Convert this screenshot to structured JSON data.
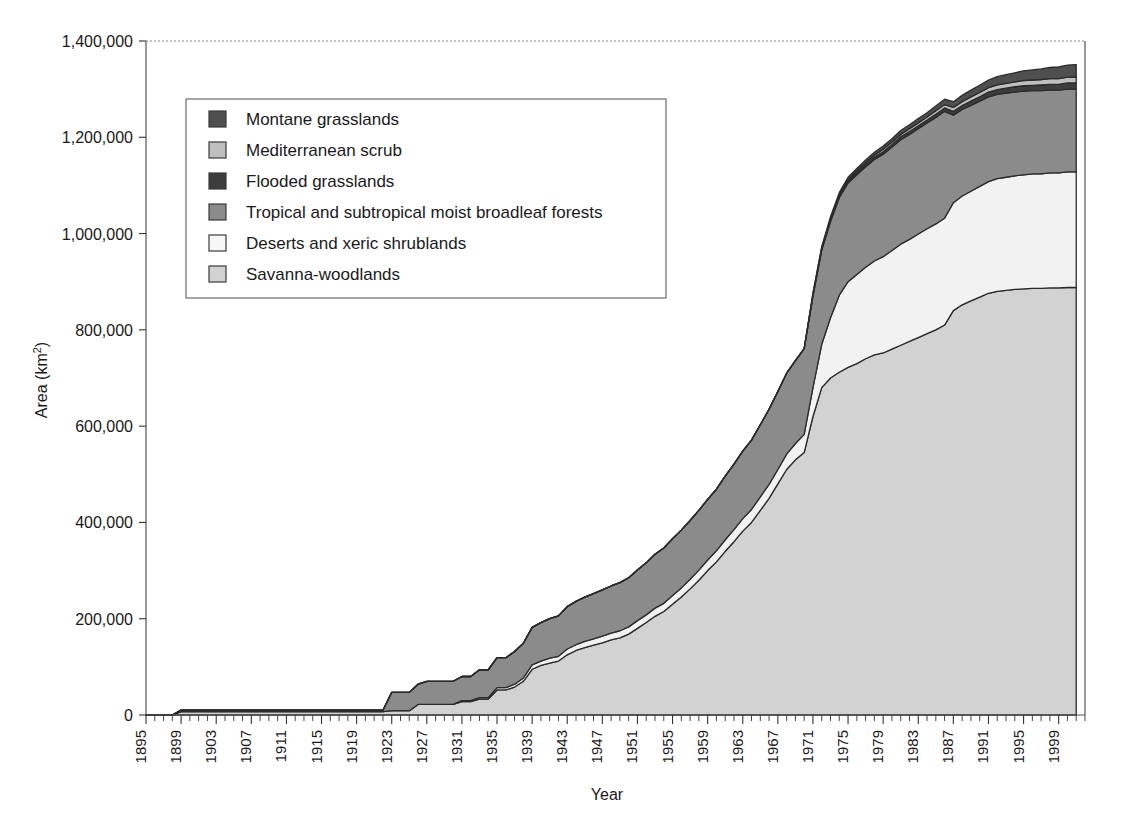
{
  "chart_data": {
    "type": "area",
    "title": "",
    "xlabel": "Year",
    "ylabel": "Area (km2)",
    "ylabel_display": "Area (km²)",
    "stacked": true,
    "grid": false,
    "legend_position": "upper-left-inside",
    "xlim": [
      1895,
      2002
    ],
    "ylim": [
      0,
      1400000
    ],
    "ytick_labels": [
      "1,400,000",
      "1,200,000",
      "1,000,000",
      "800,000",
      "600,000",
      "400,000",
      "200,000",
      "0"
    ],
    "ytick_values": [
      1400000,
      1200000,
      1000000,
      800000,
      600000,
      400000,
      200000,
      0
    ],
    "xtick_labels": [
      "1895",
      "1899",
      "1903",
      "1907",
      "1911",
      "1915",
      "1919",
      "1923",
      "1927",
      "1931",
      "1935",
      "1939",
      "1943",
      "1947",
      "1951",
      "1955",
      "1959",
      "1963",
      "1967",
      "1971",
      "1975",
      "1979",
      "1983",
      "1987",
      "1991",
      "1995",
      "1999"
    ],
    "xtick_values": [
      1895,
      1899,
      1903,
      1907,
      1911,
      1915,
      1919,
      1923,
      1927,
      1931,
      1935,
      1939,
      1943,
      1947,
      1951,
      1955,
      1959,
      1963,
      1967,
      1971,
      1975,
      1979,
      1983,
      1987,
      1991,
      1995,
      1999
    ],
    "xtick_step_minor": 1,
    "x": [
      1895,
      1896,
      1897,
      1898,
      1899,
      1900,
      1901,
      1902,
      1903,
      1904,
      1905,
      1906,
      1907,
      1908,
      1909,
      1910,
      1911,
      1912,
      1913,
      1914,
      1915,
      1916,
      1917,
      1918,
      1919,
      1920,
      1921,
      1922,
      1923,
      1924,
      1925,
      1926,
      1927,
      1928,
      1929,
      1930,
      1931,
      1932,
      1933,
      1934,
      1935,
      1936,
      1937,
      1938,
      1939,
      1940,
      1941,
      1942,
      1943,
      1944,
      1945,
      1946,
      1947,
      1948,
      1949,
      1950,
      1951,
      1952,
      1953,
      1954,
      1955,
      1956,
      1957,
      1958,
      1959,
      1960,
      1961,
      1962,
      1963,
      1964,
      1965,
      1966,
      1967,
      1968,
      1969,
      1970,
      1971,
      1972,
      1973,
      1974,
      1975,
      1976,
      1977,
      1978,
      1979,
      1980,
      1981,
      1982,
      1983,
      1984,
      1985,
      1986,
      1987,
      1988,
      1989,
      1990,
      1991,
      1992,
      1993,
      1994,
      1995,
      1996,
      1997,
      1998,
      1999,
      2000,
      2001
    ],
    "series": [
      {
        "name": "Savanna-woodlands",
        "color": "#d2d2d2",
        "stack_order": 1,
        "values": [
          0,
          0,
          0,
          0,
          7000,
          7000,
          7000,
          7000,
          7000,
          7000,
          7000,
          7000,
          7000,
          7000,
          7000,
          7000,
          7000,
          7000,
          7000,
          7000,
          7000,
          7000,
          7000,
          7000,
          7000,
          7000,
          7000,
          7000,
          9000,
          9000,
          9000,
          22000,
          22000,
          22000,
          22000,
          22000,
          28000,
          28000,
          33000,
          33000,
          52000,
          52000,
          58000,
          70000,
          95000,
          103000,
          108000,
          112000,
          125000,
          134000,
          140000,
          145000,
          150000,
          156000,
          160000,
          168000,
          180000,
          192000,
          205000,
          215000,
          230000,
          245000,
          262000,
          280000,
          300000,
          318000,
          340000,
          360000,
          382000,
          400000,
          425000,
          450000,
          480000,
          510000,
          530000,
          545000,
          620000,
          680000,
          700000,
          712000,
          722000,
          730000,
          740000,
          748000,
          752000,
          760000,
          768000,
          776000,
          784000,
          792000,
          800000,
          810000,
          840000,
          852000,
          860000,
          868000,
          876000,
          880000,
          882000,
          884000,
          885000,
          886000,
          886000,
          887000,
          887000,
          888000,
          888000
        ],
        "peak_value": 888000
      },
      {
        "name": "Deserts and xeric shrublands",
        "color": "#f2f2f2",
        "stack_order": 2,
        "values": [
          0,
          0,
          0,
          0,
          0,
          0,
          0,
          0,
          0,
          0,
          0,
          0,
          0,
          0,
          0,
          0,
          0,
          0,
          0,
          0,
          0,
          0,
          0,
          0,
          0,
          0,
          0,
          0,
          0,
          0,
          0,
          0,
          0,
          0,
          0,
          0,
          2000,
          2000,
          3000,
          3000,
          5000,
          5000,
          6000,
          7000,
          9000,
          9000,
          10000,
          10000,
          12000,
          12000,
          13000,
          13000,
          14000,
          14000,
          15000,
          15000,
          16000,
          16000,
          17000,
          17000,
          18000,
          19000,
          20000,
          21000,
          22000,
          23000,
          24000,
          25000,
          26000,
          27000,
          28000,
          29000,
          30000,
          32000,
          34000,
          38000,
          60000,
          90000,
          125000,
          160000,
          178000,
          185000,
          190000,
          195000,
          200000,
          205000,
          210000,
          212000,
          215000,
          218000,
          220000,
          222000,
          224000,
          226000,
          228000,
          230000,
          232000,
          234000,
          235000,
          236000,
          237000,
          238000,
          238000,
          239000,
          239000,
          240000,
          240000
        ],
        "peak_value": 240000
      },
      {
        "name": "Tropical and subtropical moist broadleaf forests",
        "color": "#8b8b8b",
        "stack_order": 3,
        "values": [
          0,
          0,
          0,
          0,
          3000,
          3000,
          3000,
          3000,
          3000,
          3000,
          3000,
          3000,
          3000,
          3000,
          3000,
          3000,
          3000,
          3000,
          3000,
          3000,
          3000,
          3000,
          3000,
          3000,
          3000,
          3000,
          3000,
          3000,
          38000,
          38000,
          38000,
          42000,
          48000,
          48000,
          48000,
          48000,
          50000,
          50000,
          58000,
          58000,
          62000,
          62000,
          68000,
          72000,
          78000,
          80000,
          82000,
          84000,
          88000,
          90000,
          92000,
          94000,
          96000,
          98000,
          100000,
          102000,
          105000,
          108000,
          112000,
          115000,
          118000,
          120000,
          122000,
          124000,
          126000,
          128000,
          132000,
          136000,
          140000,
          144000,
          150000,
          156000,
          162000,
          168000,
          172000,
          178000,
          190000,
          196000,
          200000,
          203000,
          205000,
          207000,
          209000,
          211000,
          213000,
          215000,
          217000,
          218000,
          219000,
          220000,
          221000,
          222000,
          182000,
          180000,
          178000,
          177000,
          176000,
          175000,
          175000,
          174000,
          174000,
          173000,
          173000,
          172000,
          172000,
          172000,
          172000
        ],
        "peak_value": 222000
      },
      {
        "name": "Flooded grasslands",
        "color": "#3d3d3d",
        "stack_order": 4,
        "values": [
          0,
          0,
          0,
          0,
          0,
          0,
          0,
          0,
          0,
          0,
          0,
          0,
          0,
          0,
          0,
          0,
          0,
          0,
          0,
          0,
          0,
          0,
          0,
          0,
          0,
          0,
          0,
          0,
          0,
          0,
          0,
          0,
          0,
          0,
          0,
          0,
          0,
          0,
          0,
          0,
          0,
          0,
          0,
          0,
          0,
          0,
          0,
          0,
          0,
          0,
          0,
          0,
          0,
          0,
          0,
          0,
          0,
          0,
          0,
          0,
          0,
          0,
          0,
          0,
          0,
          0,
          0,
          0,
          0,
          0,
          0,
          0,
          0,
          0,
          0,
          0,
          2000,
          2000,
          3000,
          3000,
          4000,
          4000,
          4000,
          5000,
          5000,
          5000,
          6000,
          6000,
          6000,
          6000,
          7000,
          7000,
          8000,
          8000,
          9000,
          9000,
          10000,
          10000,
          10000,
          11000,
          11000,
          11000,
          12000,
          12000,
          12000,
          13000,
          13000
        ],
        "peak_value": 13000
      },
      {
        "name": "Mediterranean scrub",
        "color": "#bfbfbf",
        "stack_order": 5,
        "values": [
          0,
          0,
          0,
          0,
          0,
          0,
          0,
          0,
          0,
          0,
          0,
          0,
          0,
          0,
          0,
          0,
          0,
          0,
          0,
          0,
          0,
          0,
          0,
          0,
          0,
          0,
          0,
          0,
          0,
          0,
          0,
          0,
          0,
          0,
          0,
          0,
          0,
          0,
          0,
          0,
          0,
          0,
          0,
          0,
          0,
          0,
          0,
          0,
          0,
          0,
          0,
          0,
          0,
          0,
          0,
          0,
          0,
          0,
          0,
          0,
          0,
          0,
          0,
          0,
          0,
          0,
          0,
          0,
          0,
          0,
          0,
          0,
          0,
          0,
          0,
          0,
          2000,
          2000,
          3000,
          3000,
          3000,
          4000,
          4000,
          4000,
          5000,
          5000,
          5000,
          6000,
          6000,
          6000,
          7000,
          7000,
          8000,
          8000,
          9000,
          9000,
          9000,
          10000,
          10000,
          10000,
          11000,
          11000,
          11000,
          12000,
          12000,
          12000,
          12000
        ],
        "peak_value": 12000
      },
      {
        "name": "Montane grasslands",
        "color": "#4f4f4f",
        "stack_order": 6,
        "values": [
          0,
          0,
          0,
          0,
          0,
          0,
          0,
          0,
          0,
          0,
          0,
          0,
          0,
          0,
          0,
          0,
          0,
          0,
          0,
          0,
          0,
          0,
          0,
          0,
          0,
          0,
          0,
          0,
          0,
          0,
          0,
          0,
          0,
          0,
          0,
          0,
          0,
          0,
          0,
          0,
          0,
          0,
          0,
          0,
          0,
          0,
          0,
          0,
          0,
          0,
          0,
          0,
          0,
          0,
          0,
          0,
          0,
          0,
          0,
          0,
          0,
          0,
          0,
          0,
          0,
          0,
          0,
          0,
          0,
          0,
          0,
          0,
          0,
          0,
          0,
          0,
          3000,
          3000,
          4000,
          4000,
          5000,
          5000,
          6000,
          6000,
          7000,
          7000,
          8000,
          8000,
          9000,
          9000,
          10000,
          11000,
          12000,
          13000,
          14000,
          15000,
          16000,
          17000,
          18000,
          19000,
          20000,
          21000,
          22000,
          23000,
          24000,
          25000,
          26000
        ],
        "peak_value": 26000
      }
    ],
    "total_peak": 1351000
  },
  "legend": {
    "items": [
      {
        "label": "Montane grasslands",
        "color": "#4f4f4f"
      },
      {
        "label": "Mediterranean scrub",
        "color": "#bfbfbf"
      },
      {
        "label": "Flooded grasslands",
        "color": "#3d3d3d"
      },
      {
        "label": "Tropical and subtropical moist broadleaf forests",
        "color": "#8b8b8b"
      },
      {
        "label": "Deserts and xeric shrublands",
        "color": "#f7f7f7"
      },
      {
        "label": "Savanna-woodlands",
        "color": "#d2d2d2"
      }
    ]
  },
  "axes": {
    "y_title": "Area (km²)",
    "x_title": "Year"
  }
}
